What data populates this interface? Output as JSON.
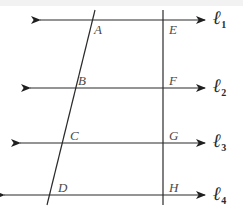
{
  "figure": {
    "kind": "geometry-diagram",
    "width": 243,
    "height": 209,
    "background_color": "#ffffff",
    "stroke_color": "#2b2b2b",
    "label_color": "#4a4a4a"
  },
  "parallel_lines": [
    {
      "id": "l1",
      "label_base": "ℓ",
      "label_sub": "1",
      "y": 20,
      "x_start": 40,
      "x_end": 205,
      "label_x": 213,
      "label_y": 8
    },
    {
      "id": "l2",
      "label_base": "ℓ",
      "label_sub": "2",
      "y": 88,
      "x_start": 30,
      "x_end": 205,
      "label_x": 213,
      "label_y": 76
    },
    {
      "id": "l3",
      "label_base": "ℓ",
      "label_sub": "3",
      "y": 143,
      "x_start": 20,
      "x_end": 205,
      "label_x": 213,
      "label_y": 131
    },
    {
      "id": "l4",
      "label_base": "ℓ",
      "label_sub": "4",
      "y": 195,
      "x_start": 4,
      "x_end": 205,
      "label_x": 213,
      "label_y": 184
    }
  ],
  "transversals": [
    {
      "id": "left-transversal",
      "x1": 95,
      "y1": 10,
      "x2": 47,
      "y2": 205,
      "points": [
        "A",
        "B",
        "C",
        "D"
      ]
    },
    {
      "id": "right-transversal",
      "x1": 163,
      "y1": 10,
      "x2": 163,
      "y2": 205,
      "points": [
        "E",
        "F",
        "G",
        "H"
      ]
    }
  ],
  "points": [
    {
      "name": "A",
      "x": 88,
      "y": 20,
      "label_x": 94,
      "label_y": 23
    },
    {
      "name": "B",
      "x": 72,
      "y": 88,
      "label_x": 78,
      "label_y": 74
    },
    {
      "name": "C",
      "x": 63,
      "y": 143,
      "label_x": 70,
      "label_y": 129
    },
    {
      "name": "D",
      "x": 51,
      "y": 195,
      "label_x": 58,
      "label_y": 181
    },
    {
      "name": "E",
      "x": 163,
      "y": 20,
      "label_x": 169,
      "label_y": 23
    },
    {
      "name": "F",
      "x": 163,
      "y": 88,
      "label_x": 169,
      "label_y": 74
    },
    {
      "name": "G",
      "x": 163,
      "y": 143,
      "label_x": 169,
      "label_y": 129
    },
    {
      "name": "H",
      "x": 163,
      "y": 195,
      "label_x": 169,
      "label_y": 181
    }
  ]
}
